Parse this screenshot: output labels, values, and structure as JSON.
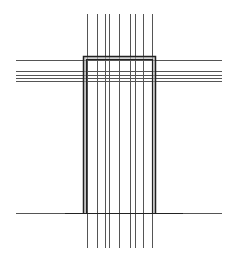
{
  "diagram": {
    "type": "line-drawing",
    "canvas": {
      "width": 236,
      "height": 261,
      "background": "#ffffff"
    },
    "colors": {
      "thin_line": "#555555",
      "thick_line": "#222222",
      "fill_band": "#bbbbbb"
    },
    "vertical_lines": {
      "x": [
        87,
        97,
        105,
        109,
        119,
        130,
        135,
        143,
        152
      ],
      "y_start": 14,
      "y_end": 248
    },
    "horizontal_lines": {
      "y": [
        60,
        71,
        75,
        78,
        81
      ],
      "x_start": 16,
      "x_end": 222
    },
    "frame": {
      "outer": {
        "x": 83,
        "y": 56,
        "width": 73,
        "height": 157
      },
      "inner": {
        "x": 86,
        "y": 59,
        "width": 67,
        "height": 154
      }
    },
    "baseline": {
      "y": 213,
      "x_start": 16,
      "x_end": 222,
      "thick_x_start": 65,
      "thick_x_end": 183
    }
  }
}
